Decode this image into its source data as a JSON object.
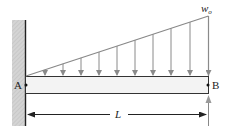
{
  "diagram": {
    "labels": {
      "load_max": "w",
      "load_max_sub": "o",
      "point_a": "A",
      "point_b": "B",
      "length": "L"
    },
    "colors": {
      "wall_fill": "#d2d2d2",
      "beam_fill": "#f2f2f2",
      "line": "#333333",
      "arrow": "#888888"
    },
    "load_arrows_x": [
      45,
      63,
      81,
      99,
      117,
      135,
      153,
      171,
      190,
      208
    ]
  }
}
